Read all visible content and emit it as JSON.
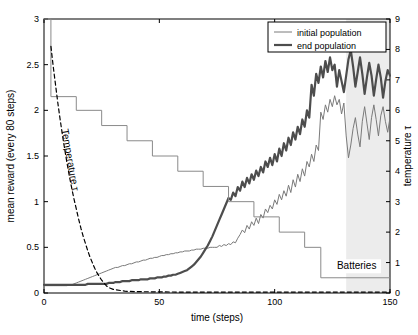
{
  "figure": {
    "background": "#ffffff",
    "axis_color": "#000000",
    "plot_frame": {
      "left": 44,
      "right": 390,
      "top": 19,
      "bottom": 293
    }
  },
  "chart_data": {
    "type": "line",
    "title": "",
    "xlabel": "time (steps)",
    "ylabel": "mean reward (every 80 steps)",
    "y2label": "temperature τ",
    "xlim": [
      0,
      150
    ],
    "ylim": [
      0,
      3
    ],
    "y2lim": [
      0,
      9
    ],
    "xticks": [
      0,
      50,
      100,
      150
    ],
    "xticklabels": [
      "0",
      "50",
      "100",
      "150"
    ],
    "yticks": [
      0,
      0.5,
      1,
      1.5,
      2,
      2.5,
      3
    ],
    "yticklabels": [
      "0",
      "0.5",
      "1",
      "1.5",
      "2",
      "2.5",
      "3"
    ],
    "y2ticks": [
      0,
      1,
      2,
      3,
      4,
      5,
      6,
      7,
      8,
      9
    ],
    "y2ticklabels": [
      "0",
      "1",
      "2",
      "3",
      "4",
      "5",
      "6",
      "7",
      "8",
      "9"
    ],
    "grid": false,
    "legend": {
      "position": "top-right",
      "entries": [
        {
          "name": "initial population",
          "color": "#7a7a7a",
          "width": 1.0
        },
        {
          "name": "end population",
          "color": "#4d4d4d",
          "width": 2.2
        }
      ]
    },
    "annotations": [
      {
        "text": "Temperature τ",
        "x": 10,
        "y": 1.45,
        "rotation": 80,
        "color": "#000000"
      },
      {
        "text": "Batteries",
        "x": 127,
        "y": 0.26,
        "rotation": 0,
        "color": "#000000"
      }
    ],
    "shaded_region": {
      "x0": 131,
      "x1": 150,
      "color": "#ececec",
      "label": ""
    },
    "series": [
      {
        "name": "initial population",
        "axis": "left",
        "color": "#7a7a7a",
        "linewidth": 1.0,
        "linestyle": "solid",
        "x": [
          0,
          1,
          2,
          3,
          4,
          5,
          6,
          7,
          8,
          9,
          10,
          11,
          12,
          13,
          14,
          15,
          16,
          17,
          18,
          19,
          20,
          21,
          22,
          23,
          24,
          25,
          26,
          27,
          28,
          29,
          30,
          31,
          32,
          33,
          34,
          35,
          36,
          37,
          38,
          39,
          40,
          41,
          42,
          43,
          44,
          45,
          46,
          47,
          48,
          49,
          50,
          51,
          52,
          53,
          54,
          55,
          56,
          57,
          58,
          59,
          60,
          61,
          62,
          63,
          64,
          65,
          66,
          67,
          68,
          69,
          70,
          71,
          72,
          73,
          74,
          75,
          76,
          77,
          78,
          79,
          80,
          81,
          82,
          83,
          84,
          85,
          86,
          87,
          88,
          89,
          90,
          91,
          92,
          93,
          94,
          95,
          96,
          97,
          98,
          99,
          100,
          101,
          102,
          103,
          104,
          105,
          106,
          107,
          108,
          109,
          110,
          111,
          112,
          113,
          114,
          115,
          116,
          117,
          118,
          119,
          120,
          121,
          122,
          123,
          124,
          125,
          126,
          127,
          128,
          129,
          130,
          131,
          132,
          133,
          134,
          135,
          136,
          137,
          138,
          139,
          140,
          141,
          142,
          143,
          144,
          145,
          146,
          147,
          148,
          149,
          150
        ],
        "y": [
          0.08,
          0.08,
          0.08,
          0.08,
          0.08,
          0.08,
          0.08,
          0.08,
          0.08,
          0.08,
          0.08,
          0.09,
          0.09,
          0.1,
          0.11,
          0.12,
          0.13,
          0.14,
          0.15,
          0.16,
          0.17,
          0.18,
          0.19,
          0.2,
          0.21,
          0.22,
          0.23,
          0.24,
          0.25,
          0.26,
          0.27,
          0.28,
          0.28,
          0.29,
          0.3,
          0.3,
          0.31,
          0.32,
          0.32,
          0.33,
          0.34,
          0.34,
          0.35,
          0.36,
          0.36,
          0.37,
          0.38,
          0.38,
          0.39,
          0.39,
          0.4,
          0.41,
          0.41,
          0.42,
          0.42,
          0.43,
          0.43,
          0.44,
          0.44,
          0.45,
          0.45,
          0.46,
          0.46,
          0.46,
          0.47,
          0.47,
          0.48,
          0.48,
          0.48,
          0.49,
          0.49,
          0.49,
          0.5,
          0.5,
          0.5,
          0.5,
          0.52,
          0.51,
          0.53,
          0.52,
          0.54,
          0.53,
          0.56,
          0.55,
          0.6,
          0.64,
          0.69,
          0.66,
          0.74,
          0.7,
          0.78,
          0.74,
          0.82,
          0.76,
          0.86,
          0.82,
          0.92,
          0.88,
          0.96,
          0.92,
          1.02,
          0.97,
          1.08,
          1.02,
          1.12,
          1.06,
          1.18,
          1.1,
          1.24,
          1.16,
          1.3,
          1.22,
          1.36,
          1.28,
          1.44,
          1.38,
          1.52,
          1.44,
          1.62,
          1.56,
          1.98,
          1.9,
          2.06,
          1.98,
          2.12,
          2.04,
          2.16,
          2.06,
          2.12,
          1.96,
          2.08,
          1.72,
          1.48,
          1.62,
          1.8,
          1.92,
          1.74,
          1.6,
          1.88,
          2.04,
          1.86,
          1.68,
          1.92,
          2.06,
          1.9,
          1.72,
          1.94,
          2.04,
          1.88,
          1.76,
          1.92
        ]
      },
      {
        "name": "end population",
        "axis": "left",
        "color": "#4d4d4d",
        "linewidth": 2.2,
        "linestyle": "solid",
        "x": [
          0,
          1,
          2,
          3,
          4,
          5,
          6,
          7,
          8,
          9,
          10,
          11,
          12,
          13,
          14,
          15,
          16,
          17,
          18,
          19,
          20,
          21,
          22,
          23,
          24,
          25,
          26,
          27,
          28,
          29,
          30,
          31,
          32,
          33,
          34,
          35,
          36,
          37,
          38,
          39,
          40,
          41,
          42,
          43,
          44,
          45,
          46,
          47,
          48,
          49,
          50,
          51,
          52,
          53,
          54,
          55,
          56,
          57,
          58,
          59,
          60,
          61,
          62,
          63,
          64,
          65,
          66,
          67,
          68,
          69,
          70,
          71,
          72,
          73,
          74,
          75,
          76,
          77,
          78,
          79,
          80,
          81,
          82,
          83,
          84,
          85,
          86,
          87,
          88,
          89,
          90,
          91,
          92,
          93,
          94,
          95,
          96,
          97,
          98,
          99,
          100,
          101,
          102,
          103,
          104,
          105,
          106,
          107,
          108,
          109,
          110,
          111,
          112,
          113,
          114,
          115,
          116,
          117,
          118,
          119,
          120,
          121,
          122,
          123,
          124,
          125,
          126,
          127,
          128,
          129,
          130,
          131,
          132,
          133,
          134,
          135,
          136,
          137,
          138,
          139,
          140,
          141,
          142,
          143,
          144,
          145,
          146,
          147,
          148,
          149,
          150
        ],
        "y": [
          0.09,
          0.09,
          0.09,
          0.09,
          0.09,
          0.09,
          0.09,
          0.09,
          0.09,
          0.09,
          0.09,
          0.09,
          0.09,
          0.09,
          0.09,
          0.09,
          0.09,
          0.09,
          0.09,
          0.1,
          0.1,
          0.1,
          0.1,
          0.1,
          0.1,
          0.1,
          0.1,
          0.1,
          0.11,
          0.11,
          0.11,
          0.12,
          0.12,
          0.12,
          0.13,
          0.13,
          0.13,
          0.13,
          0.14,
          0.14,
          0.14,
          0.14,
          0.15,
          0.15,
          0.15,
          0.15,
          0.16,
          0.16,
          0.16,
          0.17,
          0.17,
          0.17,
          0.18,
          0.18,
          0.19,
          0.19,
          0.2,
          0.2,
          0.21,
          0.22,
          0.23,
          0.24,
          0.25,
          0.27,
          0.29,
          0.31,
          0.34,
          0.37,
          0.4,
          0.44,
          0.48,
          0.52,
          0.57,
          0.62,
          0.68,
          0.74,
          0.8,
          0.86,
          0.92,
          0.98,
          1.04,
          1.02,
          1.1,
          1.06,
          1.16,
          1.12,
          1.22,
          1.16,
          1.26,
          1.2,
          1.3,
          1.24,
          1.34,
          1.28,
          1.38,
          1.32,
          1.44,
          1.38,
          1.48,
          1.4,
          1.52,
          1.44,
          1.58,
          1.5,
          1.64,
          1.56,
          1.7,
          1.62,
          1.76,
          1.68,
          1.82,
          1.74,
          1.9,
          1.82,
          2.0,
          1.92,
          2.28,
          2.16,
          2.4,
          2.3,
          2.48,
          2.36,
          2.54,
          2.42,
          2.58,
          2.44,
          2.5,
          2.26,
          2.44,
          2.32,
          2.2,
          2.38,
          2.56,
          2.66,
          2.48,
          2.26,
          2.42,
          2.58,
          2.4,
          2.18,
          2.36,
          2.52,
          2.38,
          2.16,
          2.34,
          2.5,
          2.36,
          2.14,
          2.32,
          2.44,
          2.38
        ]
      },
      {
        "name": "Batteries",
        "axis": "right",
        "color": "#8a8a8a",
        "linewidth": 1.0,
        "linestyle": "steps",
        "x": [
          0,
          3,
          3,
          14,
          14,
          25,
          25,
          36,
          36,
          47,
          47,
          58,
          58,
          69,
          69,
          80,
          80,
          91,
          91,
          102,
          102,
          113,
          113,
          120,
          120,
          150
        ],
        "y": [
          9.0,
          9.0,
          6.45,
          6.45,
          6.0,
          6.0,
          5.5,
          5.5,
          5.0,
          5.0,
          4.5,
          4.5,
          4.0,
          4.0,
          3.5,
          3.5,
          3.0,
          3.0,
          2.5,
          2.5,
          2.0,
          2.0,
          1.5,
          1.5,
          0.5,
          0.5
        ]
      },
      {
        "name": "Temperature",
        "axis": "left",
        "color": "#000000",
        "linewidth": 1.2,
        "linestyle": "dashed",
        "x": [
          3,
          4,
          5,
          6,
          7,
          8,
          9,
          10,
          11,
          12,
          13,
          14,
          15,
          16,
          17,
          18,
          19,
          20,
          21,
          22,
          23,
          24,
          25,
          26,
          27,
          28,
          30,
          35,
          40,
          50,
          60,
          70,
          80,
          90,
          100,
          110,
          120,
          130,
          140,
          150
        ],
        "y": [
          2.7,
          2.48,
          2.28,
          2.08,
          1.9,
          1.73,
          1.57,
          1.42,
          1.28,
          1.15,
          1.03,
          0.92,
          0.81,
          0.71,
          0.62,
          0.54,
          0.46,
          0.39,
          0.33,
          0.27,
          0.22,
          0.18,
          0.14,
          0.11,
          0.08,
          0.06,
          0.04,
          0.02,
          0.015,
          0.012,
          0.01,
          0.01,
          0.01,
          0.01,
          0.01,
          0.01,
          0.01,
          0.01,
          0.01,
          0.01
        ]
      }
    ]
  }
}
